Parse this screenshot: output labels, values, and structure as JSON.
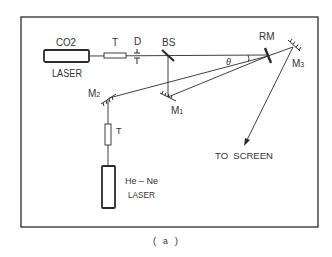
{
  "figure": {
    "caption": "( a )",
    "colors": {
      "ink": "#2b2b2b",
      "background": "#ffffff"
    }
  },
  "components": {
    "co2_laser": {
      "name": "CO2",
      "sub": "LASER"
    },
    "telescope_top": {
      "label": "T"
    },
    "detector": {
      "label": "D"
    },
    "beam_splitter": {
      "label": "BS"
    },
    "rotating_mirror": {
      "label": "RM"
    },
    "mirror_1": {
      "label": "M",
      "sub": "1"
    },
    "mirror_2": {
      "label": "M",
      "sub": "2"
    },
    "mirror_3": {
      "label": "M",
      "sub": "3"
    },
    "telescope_bottom": {
      "label": "T"
    },
    "hene_laser": {
      "name": "He – Ne",
      "sub": "LASER"
    },
    "angle": {
      "label": "θ"
    },
    "screen_arrow": {
      "label": "TO  SCREEN"
    }
  }
}
